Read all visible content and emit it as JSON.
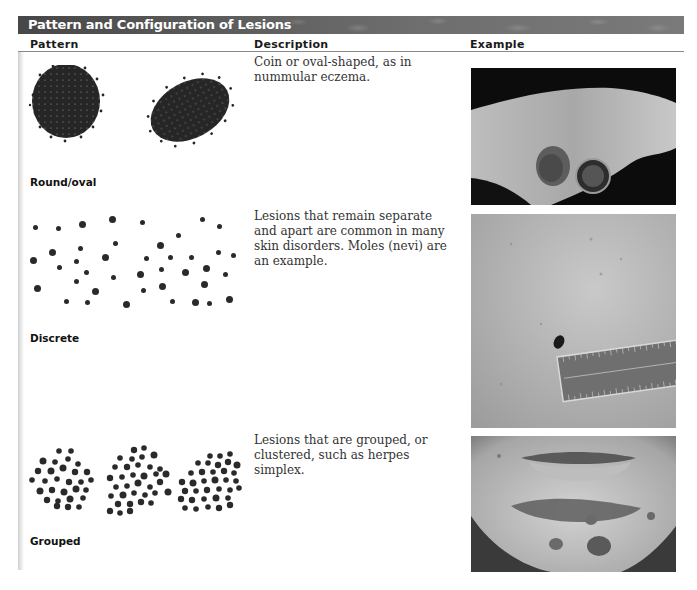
{
  "table": {
    "title": "Pattern and Configuration of Lesions",
    "columns": [
      "Pattern",
      "Description",
      "Example"
    ],
    "rows": [
      {
        "pattern": "Round/oval",
        "description": "Coin or oval-shaped, as in nummular eczema.",
        "example_image": "photo-nummular-eczema-with-coin"
      },
      {
        "pattern": "Discrete",
        "description": "Lesions that remain separate and apart are common in many skin disorders. Moles (nevi) are an example.",
        "example_image": "photo-mole-with-ruler"
      },
      {
        "pattern": "Grouped",
        "description": "Lesions that are grouped, or clustered, such as herpes simplex.",
        "example_image": "photo-herpes-simplex-chin"
      }
    ]
  },
  "colors": {
    "title_bar": "#5a5a5a",
    "title_text": "#ffffff",
    "dots": "#2a2a2a"
  }
}
